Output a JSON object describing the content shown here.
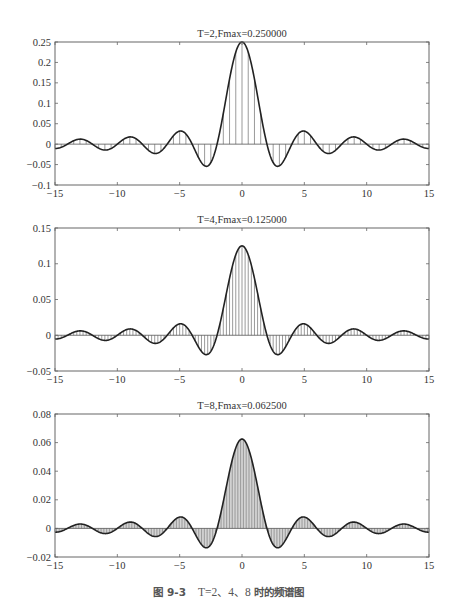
{
  "chart_data": [
    {
      "type": "line",
      "subtype": "stem+line",
      "title": "T=2,Fmax=0.250000",
      "T": 2,
      "Fmax": 0.25,
      "xlabel": "",
      "ylabel": "",
      "xlim": [
        -15,
        15
      ],
      "ylim": [
        -0.1,
        0.25
      ],
      "xticks": [
        "−15",
        "−10",
        "−5",
        "0",
        "5",
        "10",
        "15"
      ],
      "yticks": [
        "0.25",
        "0.2",
        "0.15",
        "0.1",
        "0.05",
        "0",
        "−0.05",
        "−0.1"
      ],
      "ytick_values": [
        0.25,
        0.2,
        0.15,
        0.1,
        0.05,
        0,
        -0.05,
        -0.1
      ],
      "stem_spacing": 0.5,
      "grid": false,
      "key_points": {
        "x": [
          0,
          -2.86,
          2.86,
          -4.92,
          4.92,
          -6.94,
          6.94,
          -8.95,
          8.95,
          -10.96,
          10.96,
          -12.97,
          12.97
        ],
        "y": [
          0.25,
          -0.054,
          -0.054,
          0.032,
          0.032,
          -0.023,
          -0.023,
          0.018,
          0.018,
          -0.015,
          -0.015,
          0.012,
          0.012
        ]
      }
    },
    {
      "type": "line",
      "subtype": "stem+line",
      "title": "T=4,Fmax=0.125000",
      "T": 4,
      "Fmax": 0.125,
      "xlabel": "",
      "ylabel": "",
      "xlim": [
        -15,
        15
      ],
      "ylim": [
        -0.05,
        0.15
      ],
      "xticks": [
        "−15",
        "−10",
        "−5",
        "0",
        "5",
        "10",
        "15"
      ],
      "yticks": [
        "0.15",
        "0.1",
        "0.05",
        "0",
        "−0.05"
      ],
      "ytick_values": [
        0.15,
        0.1,
        0.05,
        0,
        -0.05
      ],
      "stem_spacing": 0.25,
      "grid": false,
      "key_points": {
        "x": [
          0,
          -2.86,
          2.86,
          -4.92,
          4.92,
          -6.94,
          6.94,
          -8.95,
          8.95,
          -10.96,
          10.96,
          -12.97,
          12.97
        ],
        "y": [
          0.125,
          -0.027,
          -0.027,
          0.016,
          0.016,
          -0.011,
          -0.011,
          0.009,
          0.009,
          -0.007,
          -0.007,
          0.006,
          0.006
        ]
      }
    },
    {
      "type": "line",
      "subtype": "stem+line",
      "title": "T=8,Fmax=0.062500",
      "T": 8,
      "Fmax": 0.0625,
      "xlabel": "",
      "ylabel": "",
      "xlim": [
        -15,
        15
      ],
      "ylim": [
        -0.02,
        0.08
      ],
      "xticks": [
        "−15",
        "−10",
        "−5",
        "0",
        "5",
        "10",
        "15"
      ],
      "yticks": [
        "0.08",
        "0.06",
        "0.04",
        "0.02",
        "0",
        "−0.02"
      ],
      "ytick_values": [
        0.08,
        0.06,
        0.04,
        0.02,
        0,
        -0.02
      ],
      "stem_spacing": 0.125,
      "grid": false,
      "key_points": {
        "x": [
          0,
          -2.86,
          2.86,
          -4.92,
          4.92,
          -6.94,
          6.94,
          -8.95,
          8.95,
          -10.96,
          10.96,
          -12.97,
          12.97
        ],
        "y": [
          0.0625,
          -0.0136,
          -0.0136,
          0.008,
          0.008,
          -0.0057,
          -0.0057,
          0.0044,
          0.0044,
          -0.0036,
          -0.0036,
          0.003,
          0.003
        ]
      }
    }
  ],
  "caption": {
    "figure_number": "图 9-3",
    "text": "T=2、4、8",
    "suffix": "时的频谱图"
  },
  "colors": {
    "curve": "#222222",
    "stem": "#555555",
    "axes": "#666666",
    "text": "#333333"
  }
}
